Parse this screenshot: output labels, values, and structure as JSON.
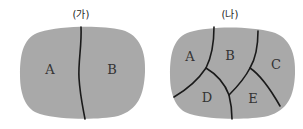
{
  "panels": [
    {
      "title": "(가)",
      "regions": [
        "A",
        "B"
      ]
    },
    {
      "title": "(나)",
      "regions": [
        "A",
        "B",
        "C",
        "D",
        "E"
      ]
    }
  ],
  "colors": {
    "fill": "#a9a9a9",
    "line": "#1a1a1a",
    "background": "#ffffff"
  }
}
